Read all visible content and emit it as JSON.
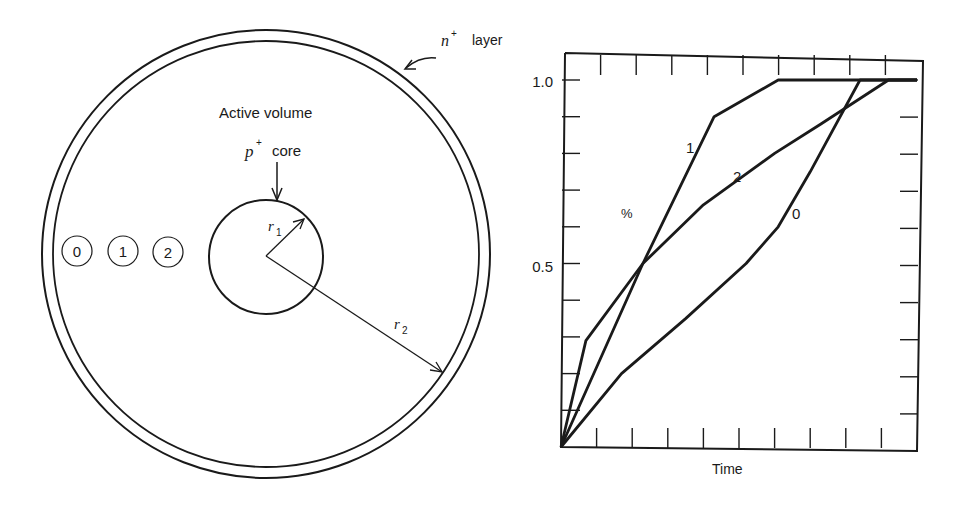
{
  "detector_diagram": {
    "labels": {
      "n_layer_symbol": "n",
      "n_layer_sup": "+",
      "n_layer_text": "layer",
      "active_volume": "Active volume",
      "p_core_symbol": "p",
      "p_core_sup": "+",
      "p_core_text": "core",
      "r1_symbol": "r",
      "r1_sub": "1",
      "r2_symbol": "r",
      "r2_sub": "2"
    },
    "positions": [
      {
        "id": "0",
        "label": "0"
      },
      {
        "id": "1",
        "label": "1"
      },
      {
        "id": "2",
        "label": "2"
      }
    ]
  },
  "chart_data": {
    "type": "line",
    "title": "",
    "xlabel": "Time",
    "ylabel": "%",
    "xlim": [
      0,
      10
    ],
    "ylim": [
      0,
      1.0
    ],
    "y_tick_labels": [
      "0.5",
      "1.0"
    ],
    "y_ticks_minor_step": 0.1,
    "x_ticks_count": 10,
    "grid": false,
    "legend": "inline curve labels",
    "series": [
      {
        "name": "0",
        "points": [
          [
            0,
            0
          ],
          [
            1.7,
            0.2
          ],
          [
            3.5,
            0.35
          ],
          [
            5.2,
            0.5
          ],
          [
            6.1,
            0.6
          ],
          [
            7.0,
            0.75
          ],
          [
            8.4,
            1.0
          ],
          [
            10,
            1.0
          ]
        ]
      },
      {
        "name": "1",
        "points": [
          [
            0,
            0
          ],
          [
            2.3,
            0.5
          ],
          [
            4.3,
            0.9
          ],
          [
            6.1,
            1.0
          ],
          [
            10,
            1.0
          ]
        ]
      },
      {
        "name": "2",
        "points": [
          [
            0,
            0
          ],
          [
            0.7,
            0.29
          ],
          [
            2.3,
            0.5
          ],
          [
            4.0,
            0.66
          ],
          [
            6.0,
            0.8
          ],
          [
            7.3,
            0.88
          ],
          [
            9.2,
            1.0
          ],
          [
            10,
            1.0
          ]
        ]
      }
    ],
    "curve_labels": [
      {
        "series": "1",
        "text": "1"
      },
      {
        "series": "2",
        "text": "2"
      },
      {
        "series": "0",
        "text": "0"
      }
    ]
  }
}
